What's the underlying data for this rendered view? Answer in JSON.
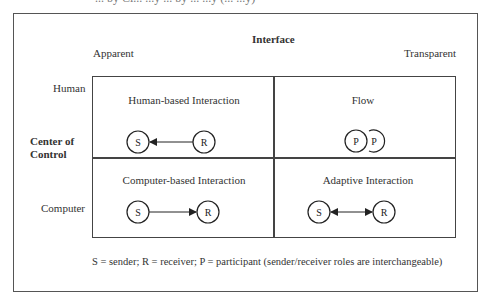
{
  "caption_clipped": "... by Ci... ...y ... by ... ...y (... ...y)",
  "header": {
    "interface_label": "Interface",
    "apparent_label": "Apparent",
    "transparent_label": "Transparent"
  },
  "rows": {
    "human_label": "Human",
    "center_of_control_line1": "Center of",
    "center_of_control_line2": "Control",
    "computer_label": "Computer"
  },
  "cells": [
    {
      "title": "Human-based Interaction",
      "left_node": "S",
      "right_node": "R",
      "arrow": "right-to-left"
    },
    {
      "title": "Flow",
      "left_node": "P",
      "right_node": "P",
      "arrow": "none"
    },
    {
      "title": "Computer-based Interaction",
      "left_node": "S",
      "right_node": "R",
      "arrow": "left-to-right"
    },
    {
      "title": "Adaptive Interaction",
      "left_node": "S",
      "right_node": "R",
      "arrow": "bidirectional"
    }
  ],
  "legend": "S = sender; R = receiver; P = participant (sender/receiver roles are interchangeable)",
  "colors": {
    "line": "#444444",
    "text": "#333333"
  }
}
